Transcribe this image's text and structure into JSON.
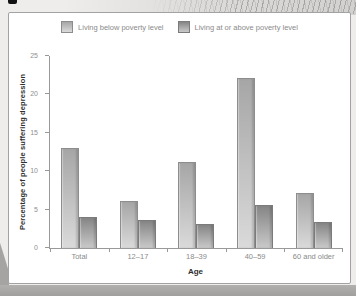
{
  "chart_data": {
    "type": "bar",
    "title": "",
    "categories": [
      "Total",
      "12–17",
      "18–39",
      "40–59",
      "60 and older"
    ],
    "series": [
      {
        "name": "Living below poverty level",
        "values": [
          13.0,
          6.1,
          11.2,
          22.1,
          7.1
        ],
        "color_top": "#a6a6a6",
        "color_bottom": "#dadada",
        "border_color": "#8d8d8d"
      },
      {
        "name": "Living at or above poverty level",
        "values": [
          4.0,
          3.6,
          3.1,
          5.6,
          3.4
        ],
        "color_top": "#858585",
        "color_bottom": "#c9c9c9",
        "border_color": "#7b7b7b"
      }
    ],
    "xlabel": "Age",
    "ylabel": "Percentage of people suffering depression",
    "ylim": [
      0,
      25
    ],
    "yticks": [
      0,
      5,
      10,
      15,
      20,
      25
    ],
    "grid": false,
    "legend_position": "top",
    "axis_color": "#999999",
    "tick_label_color": "#8f8f8f",
    "axis_title_color": "#2e2e2e"
  }
}
